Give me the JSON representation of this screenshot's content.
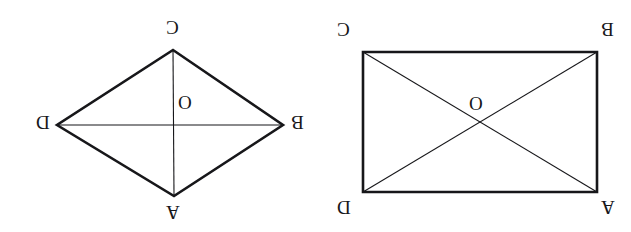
{
  "page": {
    "background_color": "#ffffff",
    "ink_color": "#17171a",
    "width": 631,
    "height": 232,
    "orientation_note": "rotated-180"
  },
  "figures": [
    {
      "id": "rhombus",
      "name": "rhombus-figure",
      "shape": "rhombus",
      "outline_stroke_width": 2.6,
      "diagonal_stroke_width": 1.1,
      "vertices": [
        {
          "label": "C",
          "x": 173,
          "y": 50,
          "position": "top"
        },
        {
          "label": "B",
          "x": 283,
          "y": 125,
          "position": "right"
        },
        {
          "label": "A",
          "x": 174,
          "y": 196,
          "position": "bottom"
        },
        {
          "label": "D",
          "x": 57,
          "y": 125,
          "position": "left"
        }
      ],
      "center": {
        "label": "O",
        "x": 174,
        "y": 125
      },
      "diagonals": [
        {
          "from": "C",
          "to": "A"
        },
        {
          "from": "D",
          "to": "B"
        }
      ],
      "labels": [
        {
          "text": "C",
          "x": 166,
          "y": 18,
          "name": "vertex-label-c"
        },
        {
          "text": "B",
          "x": 291,
          "y": 113,
          "name": "vertex-label-b"
        },
        {
          "text": "A",
          "x": 166,
          "y": 203,
          "name": "vertex-label-a"
        },
        {
          "text": "D",
          "x": 36,
          "y": 113,
          "name": "vertex-label-d"
        },
        {
          "text": "O",
          "x": 178,
          "y": 93,
          "name": "center-label-o"
        }
      ]
    },
    {
      "id": "rectangle",
      "name": "rectangle-figure",
      "shape": "rectangle",
      "outline_stroke_width": 2.6,
      "diagonal_stroke_width": 1.1,
      "vertices": [
        {
          "label": "C",
          "x": 48,
          "y": 52,
          "position": "top-left"
        },
        {
          "label": "B",
          "x": 282,
          "y": 52,
          "position": "top-right"
        },
        {
          "label": "A",
          "x": 282,
          "y": 192,
          "position": "bottom-right"
        },
        {
          "label": "D",
          "x": 48,
          "y": 192,
          "position": "bottom-left"
        }
      ],
      "center": {
        "label": "O",
        "x": 165,
        "y": 122
      },
      "diagonals": [
        {
          "from": "C",
          "to": "A"
        },
        {
          "from": "D",
          "to": "B"
        }
      ],
      "labels": [
        {
          "text": "C",
          "x": 22,
          "y": 20,
          "name": "vertex-label-c"
        },
        {
          "text": "B",
          "x": 286,
          "y": 20,
          "name": "vertex-label-b"
        },
        {
          "text": "A",
          "x": 286,
          "y": 198,
          "name": "vertex-label-a"
        },
        {
          "text": "D",
          "x": 22,
          "y": 198,
          "name": "vertex-label-d"
        },
        {
          "text": "O",
          "x": 154,
          "y": 94,
          "name": "center-label-o"
        }
      ]
    }
  ]
}
